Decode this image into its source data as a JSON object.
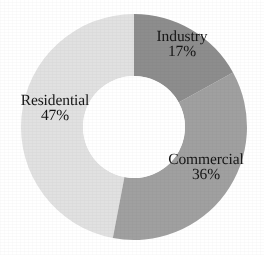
{
  "chart_data": {
    "type": "pie",
    "variant": "donut",
    "title": "",
    "subtitle": "",
    "xlabel": "",
    "ylabel": "",
    "legend": "none",
    "grid": false,
    "unit": "%",
    "total": 100,
    "start_angle_deg": 0,
    "direction": "clockwise",
    "categories": [
      "Industry",
      "Commercial",
      "Residential"
    ],
    "values": [
      17,
      36,
      47
    ],
    "labels": [
      "17%",
      "36%",
      "47%"
    ],
    "colors": [
      "#8d8d8d",
      "#a0a0a0",
      "#e1e1e1"
    ],
    "slices": [
      {
        "name": "Industry",
        "value": 17,
        "label": "17%",
        "color": "#8d8d8d",
        "start_deg": 0,
        "end_deg": 61.2
      },
      {
        "name": "Commercial",
        "value": 36,
        "label": "36%",
        "color": "#a0a0a0",
        "start_deg": 61.2,
        "end_deg": 190.8
      },
      {
        "name": "Residential",
        "value": 47,
        "label": "47%",
        "color": "#e1e1e1",
        "start_deg": 190.8,
        "end_deg": 360
      }
    ],
    "geometry": {
      "center_x": 134,
      "center_y": 127,
      "outer_radius": 113,
      "inner_radius": 51
    },
    "background_color": "#ffffff",
    "text_color": "#151515"
  }
}
